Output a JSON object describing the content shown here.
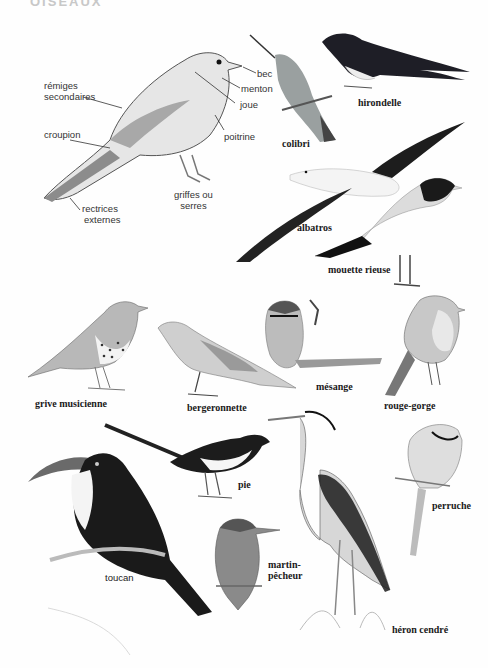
{
  "page": {
    "header_fragment": "OISEAUX",
    "background": "#fefefe"
  },
  "anatomy": {
    "bird": "oiseau (schéma)",
    "labels": {
      "remiges": "rémiges\nsecondaires",
      "remiges_line1": "rémiges",
      "remiges_line2": "secondaires",
      "croupion": "croupion",
      "rectrices_line1": "rectrices",
      "rectrices_line2": "externes",
      "griffes_line1": "griffes ou",
      "griffes_line2": "serres",
      "bec": "bec",
      "menton": "menton",
      "joue": "joue",
      "poitrine": "poitrine"
    }
  },
  "species": [
    {
      "id": "colibri",
      "label": "colibri"
    },
    {
      "id": "hirondelle",
      "label": "hirondelle"
    },
    {
      "id": "albatros",
      "label": "albatros"
    },
    {
      "id": "mouette",
      "label": "mouette rieuse"
    },
    {
      "id": "grive",
      "label": "grive musicienne"
    },
    {
      "id": "bergeronnette",
      "label": "bergeronnette"
    },
    {
      "id": "mesange",
      "label": "mésange"
    },
    {
      "id": "rouge_gorge",
      "label": "rouge-gorge"
    },
    {
      "id": "pie",
      "label": "pie"
    },
    {
      "id": "toucan",
      "label": "toucan"
    },
    {
      "id": "martin_line1",
      "label": "martin-"
    },
    {
      "id": "martin_line2",
      "label": "pêcheur"
    },
    {
      "id": "heron",
      "label": "héron cendré"
    },
    {
      "id": "perruche",
      "label": "perruche"
    }
  ],
  "colors": {
    "ink": "#1a1a1a",
    "label_gray": "#333333",
    "dark_feather": "#1e1e24",
    "mid_gray": "#8a8a8a",
    "light_gray": "#d4d4d4"
  }
}
